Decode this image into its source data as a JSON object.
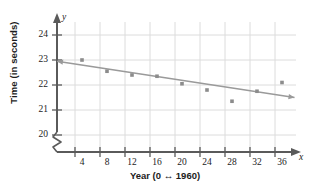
{
  "chart_data": {
    "type": "scatter",
    "title": "",
    "xlabel": "Year (0 ↔ 1960)",
    "ylabel": "Time (in seconds)",
    "x_axis_variable": "x",
    "y_axis_variable": "y",
    "xlim": [
      0,
      38
    ],
    "ylim": [
      19.6,
      24.4
    ],
    "xticks": [
      4,
      8,
      12,
      16,
      20,
      24,
      28,
      32,
      36
    ],
    "yticks": [
      20,
      21,
      22,
      23,
      24
    ],
    "xtick_labels": [
      "4",
      "8",
      "12",
      "16",
      "20",
      "24",
      "28",
      "32",
      "36"
    ],
    "ytick_labels": [
      "20",
      "21",
      "22",
      "23",
      "24"
    ],
    "y_axis_break": true,
    "grid": true,
    "legend": false,
    "x": [
      4,
      8,
      12,
      16,
      20,
      24,
      28,
      32,
      36
    ],
    "values": [
      23.0,
      22.55,
      22.4,
      22.35,
      22.05,
      21.8,
      21.35,
      21.75,
      22.1
    ],
    "points": [
      {
        "x": 4,
        "y": 23.0
      },
      {
        "x": 8,
        "y": 22.55
      },
      {
        "x": 12,
        "y": 22.4
      },
      {
        "x": 16,
        "y": 22.35
      },
      {
        "x": 20,
        "y": 22.05
      },
      {
        "x": 24,
        "y": 21.8
      },
      {
        "x": 28,
        "y": 21.35
      },
      {
        "x": 32,
        "y": 21.75
      },
      {
        "x": 36,
        "y": 22.1
      }
    ],
    "trendline": {
      "x_start": 0,
      "y_start": 22.95,
      "x_end": 38,
      "y_end": 21.5,
      "slope": -0.0382,
      "intercept": 22.95,
      "double_arrow": true
    },
    "colors": {
      "axis": "#5a5a5a",
      "grid": "#dcdcdc",
      "marker": "#8c8c8c",
      "trendline": "#9a9a9a",
      "text": "#1c1c1c"
    }
  }
}
